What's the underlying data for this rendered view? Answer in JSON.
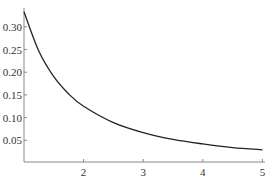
{
  "chart_data": {
    "type": "line",
    "title": "",
    "xlabel": "",
    "ylabel": "",
    "xlim": [
      1,
      5
    ],
    "ylim": [
      0.004,
      0.34
    ],
    "grid": false,
    "legend": null,
    "x_ticks": [
      "2",
      "3",
      "4",
      "5"
    ],
    "y_ticks": [
      "0.05",
      "0.10",
      "0.15",
      "0.20",
      "0.25",
      "0.30"
    ],
    "series": [
      {
        "name": "f(x)",
        "x": [
          1.0,
          1.25,
          1.5,
          1.75,
          2.0,
          2.5,
          3.0,
          3.5,
          4.0,
          4.5,
          5.0
        ],
        "values": [
          0.333,
          0.246,
          0.19,
          0.152,
          0.125,
          0.089,
          0.067,
          0.052,
          0.042,
          0.034,
          0.029
        ]
      }
    ],
    "colors": {
      "line": "#222222",
      "axis": "#888888"
    }
  }
}
